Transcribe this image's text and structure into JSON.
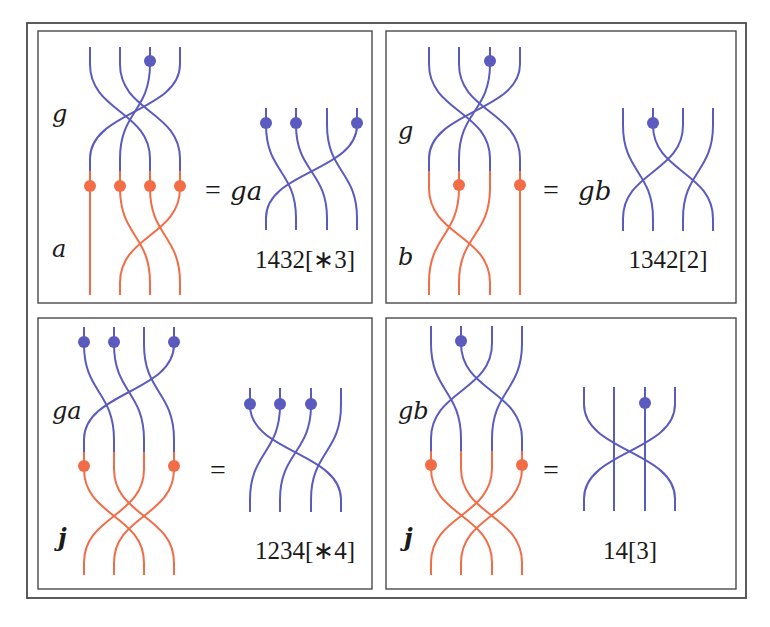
{
  "colors": {
    "blue": "#5b5bbf",
    "orange": "#f26d47",
    "frame": "#4a4a4a"
  },
  "frame": {
    "outer": {
      "x": 27,
      "y": 23,
      "w": 719,
      "h": 575
    },
    "panels": [
      {
        "x": 38,
        "y": 31,
        "w": 334,
        "h": 272
      },
      {
        "x": 386,
        "y": 31,
        "w": 350,
        "h": 272
      },
      {
        "x": 38,
        "y": 318,
        "w": 334,
        "h": 271
      },
      {
        "x": 386,
        "y": 318,
        "w": 350,
        "h": 271
      }
    ]
  },
  "panels": [
    {
      "id": "g-times-a",
      "left": {
        "xs": [
          90,
          120,
          150,
          180
        ],
        "top": {
          "label": "g",
          "label_pos": [
            52,
            115
          ],
          "y0": 47,
          "y1": 171,
          "perm": [
            2,
            3,
            1,
            0
          ],
          "dots": [
            2
          ],
          "dot_y": 61,
          "color": "blue"
        },
        "bottom": {
          "label": "a",
          "label_pos": [
            52,
            250
          ],
          "y0": 171,
          "y1": 295,
          "perm": [
            0,
            2,
            3,
            1
          ],
          "dots": [
            0,
            1,
            2,
            3
          ],
          "dot_y": 186,
          "color": "orange"
        }
      },
      "equals": {
        "text": "=",
        "pos": [
          205,
          193
        ]
      },
      "result_label": {
        "text": "ga",
        "pos": [
          230,
          193
        ]
      },
      "right": {
        "xs": [
          266,
          296,
          327,
          357
        ],
        "y0": 108,
        "y1": 230,
        "perm": [
          1,
          2,
          3,
          0
        ],
        "dots": [
          0,
          1,
          3
        ],
        "dot_y": 123,
        "color": "blue"
      },
      "code": {
        "text": "1432[∗3]",
        "pos": [
          305,
          262
        ]
      }
    },
    {
      "id": "g-times-b",
      "left": {
        "xs": [
          429,
          459,
          490,
          520
        ],
        "top": {
          "label": "g",
          "label_pos": [
            398,
            132
          ],
          "y0": 47,
          "y1": 171,
          "perm": [
            2,
            3,
            1,
            0
          ],
          "dots": [
            2
          ],
          "dot_y": 61,
          "color": "blue"
        },
        "bottom": {
          "label": "b",
          "label_pos": [
            398,
            258
          ],
          "y0": 171,
          "y1": 295,
          "perm": [
            2,
            0,
            1,
            3
          ],
          "dots": [
            1,
            3
          ],
          "dot_y": 185,
          "color": "orange"
        }
      },
      "equals": {
        "text": "=",
        "pos": [
          543,
          193
        ]
      },
      "result_label": {
        "text": "gb",
        "pos": [
          578,
          193
        ]
      },
      "right": {
        "xs": [
          623,
          653,
          683,
          713
        ],
        "y0": 108,
        "y1": 231,
        "perm": [
          1,
          3,
          0,
          2
        ],
        "dots": [
          1
        ],
        "dot_y": 123,
        "color": "blue"
      },
      "code": {
        "text": "1342[2]",
        "pos": [
          668,
          262
        ]
      }
    },
    {
      "id": "ga-times-j",
      "left": {
        "xs": [
          84,
          114,
          144,
          174
        ],
        "top": {
          "label": "ga",
          "label_pos": [
            52,
            412
          ],
          "y0": 327,
          "y1": 452,
          "perm": [
            1,
            2,
            3,
            0
          ],
          "dots": [
            0,
            1,
            3
          ],
          "dot_y": 342,
          "color": "blue"
        },
        "bottom": {
          "label": "j",
          "label_pos": [
            58,
            539
          ],
          "y0": 452,
          "y1": 575,
          "perm": [
            2,
            3,
            0,
            1
          ],
          "dots": [
            0,
            3
          ],
          "dot_y": 466,
          "color": "orange"
        }
      },
      "equals": {
        "text": "=",
        "pos": [
          210,
          473
        ]
      },
      "result_label": {
        "text": "",
        "pos": [
          0,
          0
        ]
      },
      "right": {
        "xs": [
          250,
          280,
          311,
          341
        ],
        "y0": 388,
        "y1": 512,
        "perm": [
          3,
          0,
          1,
          2
        ],
        "dots": [
          0,
          1,
          2
        ],
        "dot_y": 404,
        "color": "blue"
      },
      "code": {
        "text": "1234[∗4]",
        "pos": [
          305,
          553
        ]
      }
    },
    {
      "id": "gb-times-j",
      "left": {
        "xs": [
          431,
          461,
          492,
          522
        ],
        "top": {
          "label": "gb",
          "label_pos": [
            398,
            412
          ],
          "y0": 326,
          "y1": 451,
          "perm": [
            1,
            3,
            0,
            2
          ],
          "dots": [
            1
          ],
          "dot_y": 341,
          "color": "blue"
        },
        "bottom": {
          "label": "j",
          "label_pos": [
            404,
            539
          ],
          "y0": 451,
          "y1": 575,
          "perm": [
            2,
            3,
            0,
            1
          ],
          "dots": [
            0,
            3
          ],
          "dot_y": 465,
          "color": "orange"
        }
      },
      "equals": {
        "text": "=",
        "pos": [
          543,
          473
        ]
      },
      "result_label": {
        "text": "",
        "pos": [
          0,
          0
        ]
      },
      "right": {
        "xs": [
          584,
          614,
          645,
          675
        ],
        "y0": 387,
        "y1": 511,
        "perm": [
          3,
          1,
          2,
          0
        ],
        "dots": [
          2
        ],
        "dot_y": 403,
        "color": "blue"
      },
      "code": {
        "text": "14[3]",
        "pos": [
          630,
          553
        ]
      }
    }
  ]
}
